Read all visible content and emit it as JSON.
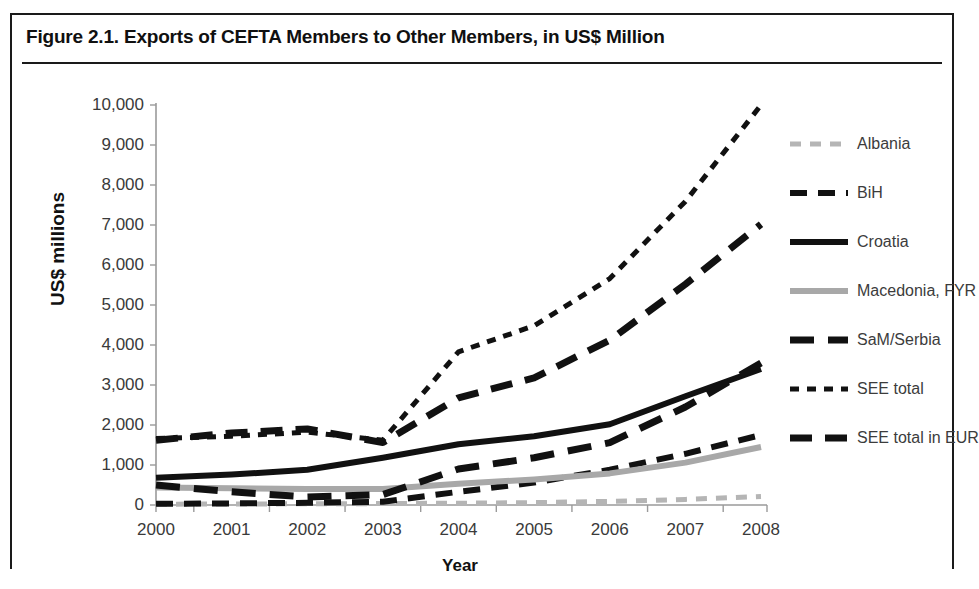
{
  "figure": {
    "title": "Figure 2.1. Exports of CEFTA Members to Other Members, in US$ Million"
  },
  "chart_data": {
    "type": "line",
    "title": "Figure 2.1. Exports of CEFTA Members to Other Members, in US$ Million",
    "xlabel": "Year",
    "ylabel": "US$ millions",
    "categories": [
      "2000",
      "2001",
      "2002",
      "2003",
      "2004",
      "2005",
      "2006",
      "2007",
      "2008"
    ],
    "x": [
      2000,
      2001,
      2002,
      2003,
      2004,
      2005,
      2006,
      2007,
      2008
    ],
    "ylim": [
      0,
      10000
    ],
    "yticks": [
      0,
      1000,
      2000,
      3000,
      4000,
      5000,
      6000,
      7000,
      8000,
      9000,
      10000
    ],
    "ytick_labels": [
      "0",
      "1,000",
      "2,000",
      "3,000",
      "4,000",
      "5,000",
      "6,000",
      "7,000",
      "8,000",
      "9,000",
      "10,000"
    ],
    "grid": false,
    "legend_position": "right",
    "series": [
      {
        "name": "Albania",
        "color": "#b5b5b5",
        "style": "dashed",
        "width": 5,
        "dash": "11,9",
        "values": [
          20,
          25,
          30,
          35,
          45,
          60,
          90,
          140,
          210
        ]
      },
      {
        "name": "BiH",
        "color": "#111111",
        "style": "dashed",
        "width": 6,
        "dash": "17,11",
        "values": [
          30,
          40,
          55,
          80,
          330,
          560,
          880,
          1280,
          1750
        ]
      },
      {
        "name": "Croatia",
        "color": "#111111",
        "style": "solid",
        "width": 6,
        "dash": "none",
        "values": [
          680,
          760,
          880,
          1180,
          1520,
          1720,
          2020,
          2720,
          3400
        ]
      },
      {
        "name": "Macedonia, FYR",
        "color": "#a8a8a8",
        "style": "solid",
        "width": 6,
        "dash": "none",
        "values": [
          440,
          420,
          400,
          400,
          530,
          640,
          790,
          1060,
          1450
        ]
      },
      {
        "name": "SaM/Serbia",
        "color": "#111111",
        "style": "dashed",
        "width": 7,
        "dash": "24,14",
        "values": [
          500,
          330,
          200,
          260,
          900,
          1180,
          1560,
          2450,
          3550
        ]
      },
      {
        "name": "SEE total",
        "color": "#111111",
        "style": "dotted",
        "width": 5,
        "dash": "9,8",
        "values": [
          1660,
          1720,
          1820,
          1620,
          3830,
          4480,
          5660,
          7590,
          10000
        ]
      },
      {
        "name": "SEE total in EUR",
        "color": "#111111",
        "style": "dashed",
        "width": 7,
        "dash": "22,13",
        "values": [
          1620,
          1800,
          1900,
          1560,
          2680,
          3180,
          4120,
          5520,
          7020
        ]
      }
    ]
  },
  "legend": {
    "items": [
      {
        "label": "Albania"
      },
      {
        "label": "BiH"
      },
      {
        "label": "Croatia"
      },
      {
        "label": "Macedonia, FYR"
      },
      {
        "label": "SaM/Serbia"
      },
      {
        "label": "SEE total"
      },
      {
        "label": "SEE total in EUR"
      }
    ]
  }
}
